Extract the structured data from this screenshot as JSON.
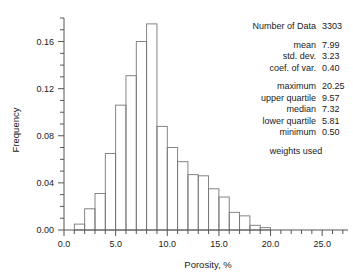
{
  "chart_data": {
    "type": "bar",
    "title": "",
    "xlabel": "Porosity, %",
    "ylabel": "Frequency",
    "xlim": [
      0.0,
      27.5
    ],
    "ylim": [
      0.0,
      0.18
    ],
    "grid": false,
    "legend": null,
    "bin_width": 1.0,
    "xticks": [
      0.0,
      5.0,
      10.0,
      15.0,
      20.0,
      25.0
    ],
    "xticklabels": [
      "0.0",
      "5.0",
      "10.0",
      "15.0",
      "20.0",
      "25.0"
    ],
    "yticks": [
      0.0,
      0.04,
      0.08,
      0.12,
      0.16
    ],
    "yticklabels": [
      "0.00",
      "0.04",
      "0.08",
      "0.12",
      "0.16"
    ],
    "xminor_step": 1.0,
    "yminor_step": 0.01,
    "bins": [
      {
        "x0": 1.0,
        "x1": 2.0,
        "value": 0.005
      },
      {
        "x0": 2.0,
        "x1": 3.0,
        "value": 0.018
      },
      {
        "x0": 3.0,
        "x1": 4.0,
        "value": 0.031
      },
      {
        "x0": 4.0,
        "x1": 5.0,
        "value": 0.065
      },
      {
        "x0": 5.0,
        "x1": 6.0,
        "value": 0.106
      },
      {
        "x0": 6.0,
        "x1": 7.0,
        "value": 0.131
      },
      {
        "x0": 7.0,
        "x1": 8.0,
        "value": 0.16
      },
      {
        "x0": 8.0,
        "x1": 9.0,
        "value": 0.175
      },
      {
        "x0": 9.0,
        "x1": 10.0,
        "value": 0.088
      },
      {
        "x0": 10.0,
        "x1": 11.0,
        "value": 0.07
      },
      {
        "x0": 11.0,
        "x1": 12.0,
        "value": 0.058
      },
      {
        "x0": 12.0,
        "x1": 13.0,
        "value": 0.047
      },
      {
        "x0": 13.0,
        "x1": 14.0,
        "value": 0.046
      },
      {
        "x0": 14.0,
        "x1": 15.0,
        "value": 0.035
      },
      {
        "x0": 15.0,
        "x1": 16.0,
        "value": 0.028
      },
      {
        "x0": 16.0,
        "x1": 17.0,
        "value": 0.015
      },
      {
        "x0": 17.0,
        "x1": 18.0,
        "value": 0.012
      },
      {
        "x0": 18.0,
        "x1": 19.0,
        "value": 0.004
      },
      {
        "x0": 19.0,
        "x1": 20.0,
        "value": 0.002
      }
    ]
  },
  "stats": {
    "count": {
      "label": "Number of Data",
      "value": "3303"
    },
    "rows_group1": [
      {
        "label": "mean",
        "value": "7.99"
      },
      {
        "label": "std. dev.",
        "value": "3.23"
      },
      {
        "label": "coef. of var.",
        "value": "0.40"
      }
    ],
    "rows_group2": [
      {
        "label": "maximum",
        "value": "20.25"
      },
      {
        "label": "upper quartile",
        "value": "9.57"
      },
      {
        "label": "median",
        "value": "7.32"
      },
      {
        "label": "lower quartile",
        "value": "5.81"
      },
      {
        "label": "minimum",
        "value": "0.50"
      }
    ],
    "note": "weights used"
  }
}
